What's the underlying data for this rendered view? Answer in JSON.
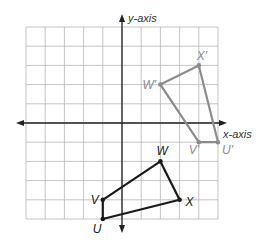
{
  "diagram": {
    "type": "coordinate-plane-transformation",
    "axes": {
      "x_label": "x-axis",
      "y_label": "y-axis",
      "xlim": [
        -5,
        5
      ],
      "ylim": [
        -5,
        5
      ],
      "grid_step": 1
    },
    "colors": {
      "grid": "#b5b5b5",
      "axis": "#222222",
      "original": "#1a1a1a",
      "image": "#8c8c8c",
      "image_label": "#8c8c8c"
    },
    "original": {
      "name": "UVWX",
      "vertices": [
        {
          "label": "U",
          "x": -1,
          "y": -5
        },
        {
          "label": "V",
          "x": -1,
          "y": -4
        },
        {
          "label": "W",
          "x": 2,
          "y": -2
        },
        {
          "label": "X",
          "x": 3,
          "y": -4
        }
      ]
    },
    "image": {
      "name": "U'V'W'X'",
      "vertices": [
        {
          "label": "U'",
          "x": 5,
          "y": -1
        },
        {
          "label": "V'",
          "x": 4,
          "y": -1
        },
        {
          "label": "W'",
          "x": 2,
          "y": 2
        },
        {
          "label": "X'",
          "x": 4,
          "y": 3
        }
      ]
    }
  }
}
